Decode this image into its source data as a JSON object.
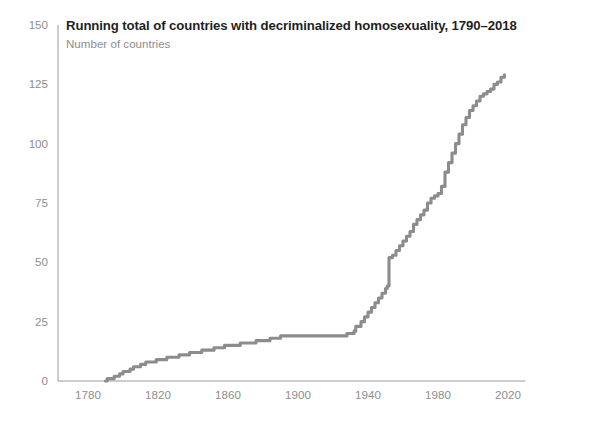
{
  "chart": {
    "title": "Running total of countries with decriminalized homosexuality, 1790–2018",
    "subtitle": "Number of countries"
  },
  "chart_data": {
    "type": "line",
    "title": "Running total of countries with decriminalized homosexuality, 1790–2018",
    "subtitle": "Number of countries",
    "xlabel": "",
    "ylabel": "Number of countries",
    "xlim": [
      1775,
      2030
    ],
    "ylim": [
      0,
      150
    ],
    "grid": false,
    "legend": "none",
    "line_color": "#8c8c8c",
    "x_ticks": [
      1780,
      1820,
      1860,
      1900,
      1940,
      1980,
      2020
    ],
    "y_ticks": [
      0,
      25,
      50,
      75,
      100,
      125,
      150
    ],
    "series": [
      {
        "name": "Running total of countries with decriminalized homosexuality",
        "x": [
          1790,
          1791,
          1795,
          1798,
          1800,
          1804,
          1806,
          1808,
          1810,
          1811,
          1813,
          1815,
          1819,
          1822,
          1825,
          1830,
          1832,
          1836,
          1838,
          1842,
          1845,
          1848,
          1852,
          1856,
          1858,
          1861,
          1864,
          1867,
          1870,
          1873,
          1876,
          1880,
          1884,
          1886,
          1889,
          1890,
          1894,
          1898,
          1902,
          1906,
          1910,
          1914,
          1918,
          1922,
          1926,
          1928,
          1930,
          1932,
          1933,
          1936,
          1938,
          1940,
          1942,
          1944,
          1946,
          1948,
          1950,
          1951,
          1952,
          1954,
          1956,
          1958,
          1960,
          1962,
          1964,
          1966,
          1968,
          1970,
          1972,
          1974,
          1976,
          1978,
          1980,
          1982,
          1984,
          1986,
          1988,
          1990,
          1992,
          1994,
          1996,
          1998,
          2000,
          2002,
          2004,
          2006,
          2008,
          2010,
          2012,
          2014,
          2016,
          2018
        ],
        "y": [
          0,
          1,
          2,
          3,
          4,
          5,
          6,
          6,
          7,
          7,
          8,
          8,
          9,
          9,
          10,
          10,
          11,
          11,
          12,
          12,
          13,
          13,
          14,
          14,
          15,
          15,
          15,
          16,
          16,
          16,
          17,
          17,
          18,
          18,
          18,
          19,
          19,
          19,
          19,
          19,
          19,
          19,
          19,
          19,
          19,
          20,
          20,
          21,
          23,
          25,
          27,
          29,
          31,
          33,
          35,
          37,
          39,
          40,
          52,
          53,
          55,
          57,
          59,
          61,
          63,
          66,
          68,
          70,
          72,
          75,
          77,
          78,
          79,
          82,
          88,
          92,
          96,
          100,
          104,
          108,
          111,
          114,
          116,
          118,
          120,
          121,
          122,
          123,
          125,
          126,
          128,
          129
        ],
        "color": "#8c8c8c"
      }
    ]
  }
}
